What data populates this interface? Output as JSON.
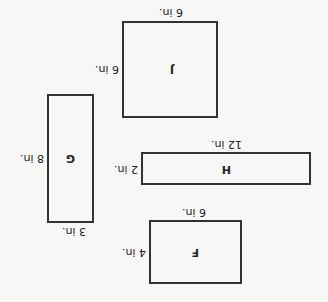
{
  "orientation": "rotated 180 degrees (upside-down)",
  "shapes": [
    {
      "name": "F",
      "width": "6 in.",
      "height": "4 in."
    },
    {
      "name": "G",
      "width": "3 in.",
      "height": "8 in."
    },
    {
      "name": "H",
      "width": "12 in.",
      "height": "2 in."
    },
    {
      "name": "J",
      "width": "6 in.",
      "height": "6 in."
    }
  ],
  "colors": {
    "stroke": "#333333",
    "background": "#f7f7f5"
  }
}
